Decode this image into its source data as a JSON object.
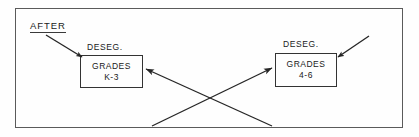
{
  "diagram": {
    "title_label": "AFTER",
    "boxes": [
      {
        "id": "k3",
        "header": "DESEG.",
        "line1": "GRADES",
        "line2": "K-3"
      },
      {
        "id": "46",
        "header": "DESEG.",
        "line1": "GRADES",
        "line2": "4-6"
      }
    ],
    "connectors": [
      {
        "name": "pointer-to-k3-box",
        "kind": "short-arrow",
        "from": [
          46,
          35
        ],
        "to": [
          82,
          57
        ],
        "arrowhead": "to"
      },
      {
        "name": "pointer-to-46-box",
        "kind": "short-arrow",
        "from": [
          369,
          36
        ],
        "to": [
          338,
          57
        ],
        "arrowhead": "to"
      },
      {
        "name": "crossing-arrow-to-k3",
        "kind": "long-arrow",
        "from": [
          272,
          126
        ],
        "to": [
          144,
          69
        ],
        "arrowhead": "to"
      },
      {
        "name": "crossing-arrow-to-46",
        "kind": "long-arrow",
        "from": [
          152,
          126
        ],
        "to": [
          274,
          68
        ],
        "arrowhead": "to"
      }
    ],
    "colors": {
      "background": "#fefefe",
      "frame_stroke": "#5a5a5a",
      "box_stroke": "#333333",
      "line_stroke": "#262626",
      "text": "#1a1a1a"
    }
  }
}
